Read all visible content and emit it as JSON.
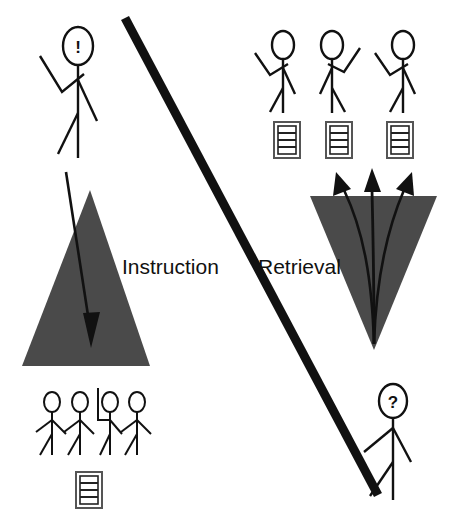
{
  "diagram": {
    "background_color": "#ffffff",
    "stroke_color": "#111111",
    "triangle_fill": "#4a4a4a",
    "divider": {
      "name": "diagonal-divider",
      "x1": 125,
      "y1": 18,
      "x2": 378,
      "y2": 495,
      "width": 9
    },
    "labels": {
      "left": "Instruction",
      "right": "Retrieval",
      "left_x": 122,
      "left_y": 274,
      "right_x": 258,
      "right_y": 274
    },
    "left_panel": {
      "name": "instruction-panel",
      "speaker": {
        "name": "instructor-figure",
        "head_glyph": "!",
        "head_cx": 78,
        "head_cy": 46,
        "head_rx": 15,
        "head_ry": 19
      },
      "triangle": {
        "name": "instruction-triangle",
        "points": "90,190 150,366 22,366",
        "orientation": "apex-up"
      },
      "arrow": {
        "name": "instruction-arrow",
        "from_x": 66,
        "from_y": 172,
        "to_x": 92,
        "to_y": 345,
        "direction": "downward"
      },
      "audience": {
        "name": "audience-figures",
        "count": 4,
        "figures": [
          {
            "name": "audience-figure-1",
            "x": 52,
            "arm": "none"
          },
          {
            "name": "audience-figure-2",
            "x": 78,
            "arm": "none"
          },
          {
            "name": "audience-figure-3",
            "x": 108,
            "arm": "raised-up"
          },
          {
            "name": "audience-figure-4",
            "x": 134,
            "arm": "none"
          }
        ]
      },
      "document": {
        "name": "document-icon-shared",
        "x": 76,
        "y": 472,
        "w": 26,
        "h": 36,
        "lines": 3
      }
    },
    "right_panel": {
      "name": "retrieval-panel",
      "responders": {
        "name": "responder-figures",
        "count": 3,
        "figures": [
          {
            "name": "responder-figure-1",
            "x": 283,
            "arm": "raised-left"
          },
          {
            "name": "responder-figure-2",
            "x": 337,
            "arm": "raised-right"
          },
          {
            "name": "responder-figure-3",
            "x": 400,
            "arm": "raised-left"
          }
        ]
      },
      "documents": {
        "name": "retrieved-document-icons",
        "count": 3,
        "items": [
          {
            "name": "document-icon-1",
            "x": 274,
            "y": 122,
            "w": 26,
            "h": 36,
            "lines": 3
          },
          {
            "name": "document-icon-2",
            "x": 326,
            "y": 122,
            "w": 26,
            "h": 36,
            "lines": 3
          },
          {
            "name": "document-icon-3",
            "x": 387,
            "y": 122,
            "w": 26,
            "h": 36,
            "lines": 3
          }
        ]
      },
      "triangle": {
        "name": "retrieval-triangle",
        "points": "310,196 437,196 374,350",
        "orientation": "apex-down"
      },
      "arrows": {
        "name": "retrieval-arrows",
        "count": 3,
        "origin_x": 374,
        "origin_y": 344,
        "tips": [
          {
            "name": "retrieval-arrow-left",
            "x": 338,
            "y": 170
          },
          {
            "name": "retrieval-arrow-center",
            "x": 372,
            "y": 168
          },
          {
            "name": "retrieval-arrow-right",
            "x": 408,
            "y": 170
          }
        ]
      },
      "asker": {
        "name": "asker-figure",
        "head_glyph": "?",
        "head_cx": 393,
        "head_cy": 401,
        "head_rx": 14,
        "head_ry": 17
      }
    }
  }
}
